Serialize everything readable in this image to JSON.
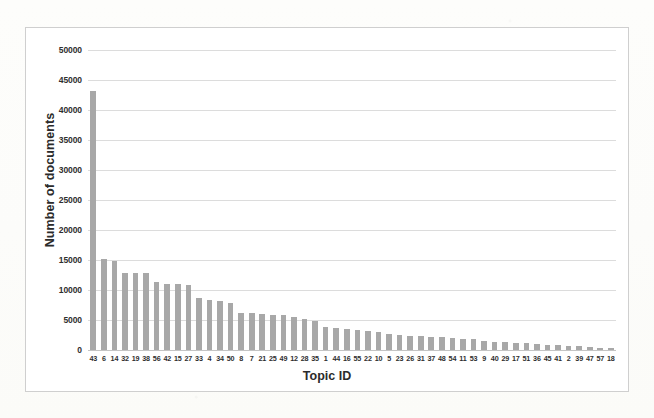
{
  "chart_data": {
    "type": "bar",
    "title": "",
    "xlabel": "Topic ID",
    "ylabel": "Number of documents",
    "ylim": [
      0,
      50000
    ],
    "ytick_values": [
      0,
      5000,
      10000,
      15000,
      20000,
      25000,
      30000,
      35000,
      40000,
      45000,
      50000
    ],
    "ytick_labels": [
      "0",
      "5000",
      "10000",
      "15000",
      "20000",
      "25000",
      "30000",
      "35000",
      "40000",
      "45000",
      "50000"
    ],
    "grid": true,
    "legend": false,
    "bar_color": "#a8a8a8",
    "categories": [
      "43",
      "6",
      "14",
      "32",
      "19",
      "38",
      "56",
      "42",
      "15",
      "27",
      "33",
      "4",
      "34",
      "50",
      "8",
      "7",
      "21",
      "25",
      "49",
      "12",
      "28",
      "35",
      "1",
      "44",
      "16",
      "55",
      "22",
      "10",
      "5",
      "23",
      "26",
      "31",
      "37",
      "48",
      "54",
      "11",
      "53",
      "9",
      "40",
      "29",
      "17",
      "51",
      "36",
      "45",
      "41",
      "2",
      "39",
      "47",
      "57",
      "18"
    ],
    "values": [
      43200,
      15100,
      14900,
      12900,
      12800,
      12800,
      11300,
      11000,
      11000,
      10800,
      8700,
      8400,
      8200,
      7800,
      6200,
      6100,
      6000,
      5900,
      5800,
      5500,
      5200,
      4800,
      3900,
      3700,
      3500,
      3300,
      3200,
      3000,
      2600,
      2500,
      2400,
      2300,
      2200,
      2100,
      2000,
      1900,
      1800,
      1500,
      1400,
      1300,
      1200,
      1100,
      1000,
      900,
      800,
      700,
      600,
      500,
      400,
      300
    ]
  },
  "axes": {
    "x_title": "Topic ID",
    "y_title": "Number of documents"
  }
}
